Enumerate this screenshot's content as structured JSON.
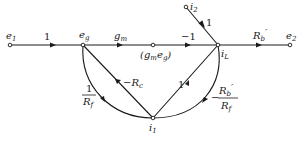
{
  "diagram": {
    "type": "signal-flow-graph",
    "nodes": [
      {
        "id": "e1",
        "label": "e",
        "sub": "1"
      },
      {
        "id": "eg",
        "label": "e",
        "sub": "g"
      },
      {
        "id": "gmeg",
        "label": "(g",
        "sub": "m",
        "tail": "e",
        "tail_sub": "g",
        "close": ")"
      },
      {
        "id": "iL",
        "label": "i",
        "sub": "L"
      },
      {
        "id": "e2",
        "label": "e",
        "sub": "2"
      },
      {
        "id": "i2",
        "label": "i",
        "sub": "2"
      },
      {
        "id": "i1",
        "label": "i",
        "sub": "1"
      }
    ],
    "edges": [
      {
        "from": "e1",
        "to": "eg",
        "gain": "1"
      },
      {
        "from": "eg",
        "to": "gmeg",
        "gain": "g",
        "gain_sub": "m"
      },
      {
        "from": "gmeg",
        "to": "iL",
        "gain": "−1"
      },
      {
        "from": "iL",
        "to": "e2",
        "gain": "R",
        "gain_sub": "b",
        "gain_prime": "′"
      },
      {
        "from": "i2",
        "to": "iL",
        "gain": "1"
      },
      {
        "from": "eg",
        "to": "i1",
        "gain_num": "1",
        "gain_den": "R",
        "gain_den_sub": "f"
      },
      {
        "from": "i1",
        "to": "eg",
        "gain": "−R",
        "gain_sub": "c"
      },
      {
        "from": "i1",
        "to": "iL",
        "gain": "1"
      },
      {
        "from": "iL",
        "to": "i1",
        "gain_sign": "−",
        "gain_num": "R",
        "gain_num_sub": "b",
        "gain_num_prime": "′",
        "gain_den": "R",
        "gain_den_sub": "f"
      }
    ]
  }
}
